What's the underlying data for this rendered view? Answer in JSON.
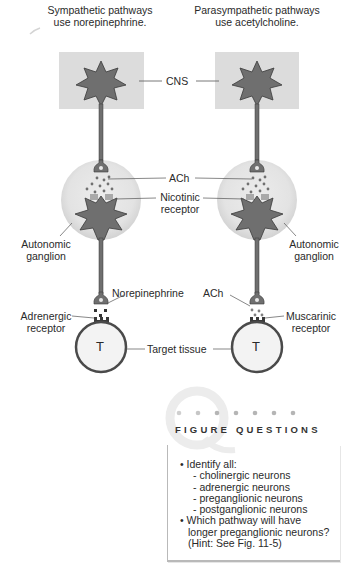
{
  "diagram": {
    "left_title": [
      "Sympathetic pathways",
      "use norepinephrine."
    ],
    "right_title": [
      "Parasympathetic pathways",
      "use acetylcholine."
    ],
    "labels": {
      "cns": "CNS",
      "ach_top": "ACh",
      "nicotinic": [
        "Nicotinic",
        "receptor"
      ],
      "autonomic_left": [
        "Autonomic",
        "ganglion"
      ],
      "autonomic_right": [
        "Autonomic",
        "ganglion"
      ],
      "norepinephrine": "Norepinephrine",
      "ach_bottom": "ACh",
      "adrenergic": [
        "Adrenergic",
        "receptor"
      ],
      "muscarinic": [
        "Muscarinic",
        "receptor"
      ],
      "target_tissue": "Target tissue",
      "target_left": "T",
      "target_right": "T"
    },
    "colors": {
      "cns_box": "#dcdcdc",
      "neuron_fill": "#6f6f6f",
      "neuron_stroke": "#3a3a3a",
      "ganglion_fill": "#e6e6e6",
      "target_fill": "#f3f3f3",
      "target_stroke": "#4a4a4a"
    }
  },
  "figure_questions": {
    "title": "FIGURE QUESTIONS",
    "items": [
      "• Identify all:",
      "- cholinergic neurons",
      "- adrenergic neurons",
      "- preganglionic neurons",
      "- postganglionic neurons",
      "• Which pathway will have",
      "longer preganglionic neurons?",
      "(Hint: See Fig. 11-5)"
    ]
  }
}
